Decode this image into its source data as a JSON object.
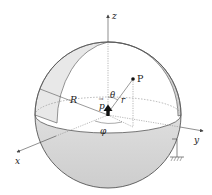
{
  "figure": {
    "colors": {
      "background": "#ffffff",
      "outline": "#555555",
      "shade_light": "#e6e6e6",
      "shade_dark": "#cfcfcf",
      "dotted": "#888888",
      "dipole": "#111111"
    }
  },
  "axes": {
    "x_label": "x",
    "y_label": "y",
    "z_label": "z"
  },
  "labels": {
    "point": "P",
    "radius": "R",
    "distance": "r",
    "polar_angle": "θ",
    "azimuth_angle": "φ",
    "dipole": "p",
    "dipole_arrow": "→"
  },
  "symbols": {
    "dipole_icon": "upward-arrow",
    "ground_icon": "ground-hatch"
  }
}
